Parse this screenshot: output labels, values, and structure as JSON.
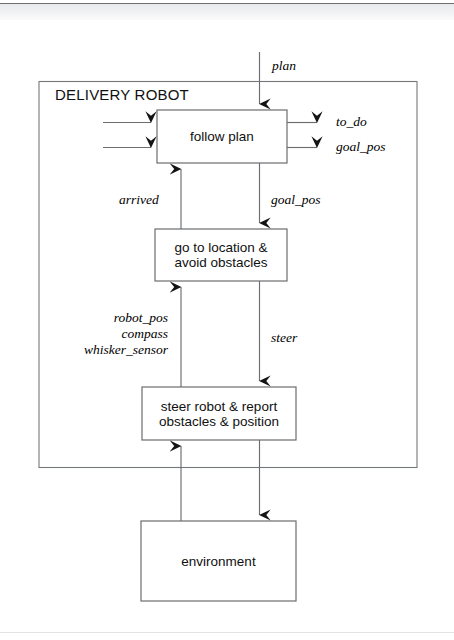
{
  "figure": {
    "type": "block-diagram",
    "system_label": "DELIVERY ROBOT",
    "stroke_color": "#6b6d70",
    "arrow_color": "#1a1a1a",
    "background": "#ffffff"
  },
  "boxes": {
    "follow_plan": {
      "label": "follow plan"
    },
    "go_to_location": {
      "line1": "go to location &",
      "line2": "avoid obstacles"
    },
    "steer_robot": {
      "line1": "steer robot & report",
      "line2": "obstacles & position"
    },
    "environment": {
      "label": "environment"
    }
  },
  "signals": {
    "plan": "plan",
    "to_do": "to_do",
    "goal_pos_out": "goal_pos",
    "arrived": "arrived",
    "goal_pos_down": "goal_pos",
    "robot_pos": "robot_pos",
    "compass": "compass",
    "whisker_sensor": "whisker_sensor",
    "steer": "steer"
  }
}
